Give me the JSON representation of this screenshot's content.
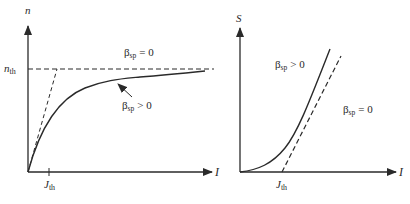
{
  "left_panel": {
    "y_axis_label": "n",
    "x_axis_label": "I",
    "y_tick_label": {
      "main": "n",
      "sub": "th"
    },
    "x_tick_label": {
      "main": "J",
      "sub": "th"
    },
    "label_beta_zero": {
      "symbol": "β",
      "sub": "sp",
      "relation": "= 0"
    },
    "label_beta_pos": {
      "symbol": "β",
      "sub": "sp",
      "relation": "> 0"
    },
    "curves": [
      {
        "name": "beta_sp_zero",
        "style": "dashed",
        "description": "step to n_th at threshold (horizontal asymptote n = n_th)"
      },
      {
        "name": "beta_sp_positive",
        "style": "solid",
        "description": "smoothly saturating carrier density approaching n_th"
      },
      {
        "name": "initial_slope",
        "style": "dashed",
        "description": "linear tangent from origin to n_th"
      }
    ]
  },
  "right_panel": {
    "y_axis_label": "S",
    "x_axis_label": "I",
    "x_tick_label": {
      "main": "J",
      "sub": "th"
    },
    "label_beta_pos": {
      "symbol": "β",
      "sub": "sp",
      "relation": "> 0"
    },
    "label_beta_zero": {
      "symbol": "β",
      "sub": "sp",
      "relation": "= 0"
    },
    "curves": [
      {
        "name": "beta_sp_positive",
        "style": "solid",
        "description": "photon number rising smoothly from origin"
      },
      {
        "name": "beta_sp_zero",
        "style": "dashed",
        "description": "linear above threshold starting at J_th"
      }
    ]
  },
  "colors": {
    "line": "#2a2a2a",
    "background": "#ffffff"
  }
}
